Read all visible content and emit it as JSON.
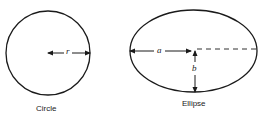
{
  "diagram": {
    "circle": {
      "caption": "Circle",
      "radius_label": "r"
    },
    "ellipse": {
      "caption": "Ellipse",
      "semi_major_label": "a",
      "semi_minor_label": "b"
    },
    "colors": {
      "stroke": "#1a1a1a",
      "background": "#ffffff"
    }
  }
}
